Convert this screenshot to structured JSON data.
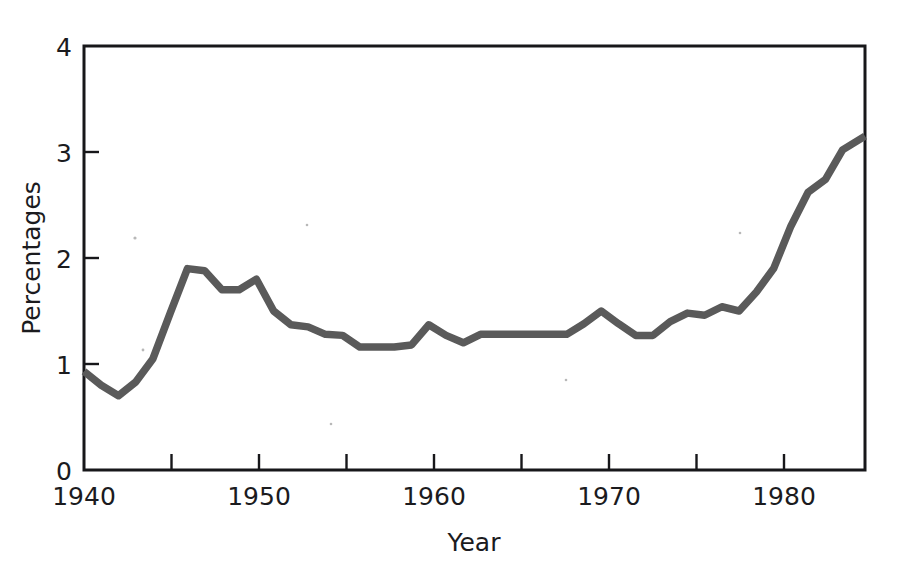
{
  "chart_data": {
    "type": "line",
    "title": "",
    "subtitle": "",
    "xlabel": "Year",
    "ylabel": "Percentages",
    "xlim": [
      1940,
      1985.3
    ],
    "ylim": [
      0,
      4
    ],
    "grid": false,
    "legend": null,
    "line_color": "#5a5a5a",
    "axis_color": "#17171a",
    "x_major_ticks": [
      1940,
      1950,
      1960,
      1970,
      1980
    ],
    "x_major_tick_labels": [
      "1940",
      "1950",
      "1960",
      "1970",
      "1980"
    ],
    "x_minor_ticks": [
      1945,
      1955,
      1965,
      1975,
      1985
    ],
    "y_ticks": [
      0,
      1,
      2,
      3,
      4
    ],
    "y_tick_labels": [
      "0",
      "1",
      "2",
      "3",
      "4"
    ],
    "series": [
      {
        "name": "Percentages",
        "x": [
          1940,
          1941,
          1942,
          1943,
          1944,
          1945,
          1946,
          1947,
          1948,
          1949,
          1950,
          1951,
          1952,
          1953,
          1954,
          1955,
          1956,
          1957,
          1958,
          1959,
          1960,
          1961,
          1962,
          1963,
          1964,
          1965,
          1966,
          1967,
          1968,
          1969,
          1970,
          1971,
          1972,
          1973,
          1974,
          1975,
          1976,
          1977,
          1978,
          1979,
          1980,
          1981,
          1982,
          1983,
          1984,
          1985.3
        ],
        "values": [
          0.93,
          0.8,
          0.7,
          0.83,
          1.05,
          1.48,
          1.9,
          1.88,
          1.7,
          1.7,
          1.8,
          1.5,
          1.37,
          1.35,
          1.28,
          1.27,
          1.16,
          1.16,
          1.16,
          1.18,
          1.37,
          1.27,
          1.2,
          1.28,
          1.28,
          1.28,
          1.28,
          1.28,
          1.28,
          1.38,
          1.5,
          1.38,
          1.27,
          1.27,
          1.4,
          1.48,
          1.46,
          1.54,
          1.5,
          1.68,
          1.9,
          2.3,
          2.62,
          2.74,
          3.02,
          3.15
        ]
      }
    ]
  },
  "axes": {
    "y_label": "Percentages",
    "x_label": "Year"
  }
}
